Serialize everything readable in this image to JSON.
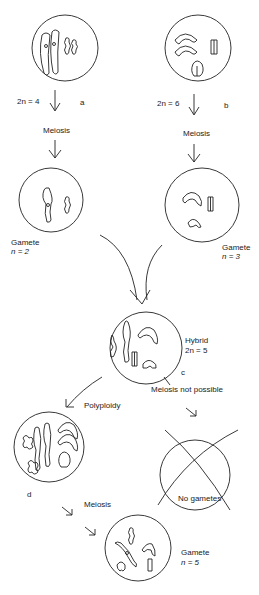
{
  "diagram": {
    "parent_a": {
      "ploidy": "2n = 4",
      "tag": "a",
      "step": "Meiosis"
    },
    "parent_b": {
      "ploidy": "2n = 6",
      "tag": "b",
      "step": "Meiosis"
    },
    "gamete_a": {
      "title": "Gamete",
      "ploidy": "n = 2"
    },
    "gamete_b": {
      "title": "Gamete",
      "ploidy": "n = 3"
    },
    "hybrid": {
      "title": "Hybrid",
      "ploidy": "2n = 5",
      "tag": "c"
    },
    "meiosis_fail": "Meiosis not possible",
    "polyploidy": "Polyploidy",
    "polyploid_tag": "d",
    "no_gametes": "No gametes",
    "final_step": "Meiosis",
    "final_gamete": {
      "title": "Gamete",
      "ploidy": "n = 5"
    },
    "colors": {
      "line": "#222222",
      "background": "#ffffff"
    }
  }
}
